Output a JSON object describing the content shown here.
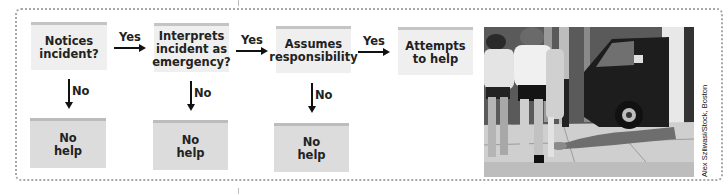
{
  "diagram": {
    "steps": [
      {
        "id": "notices",
        "label": "Notices\nincident?"
      },
      {
        "id": "interprets",
        "label": "Interprets\nincident as\nemergency?"
      },
      {
        "id": "assumes",
        "label": "Assumes\nresponsibility"
      },
      {
        "id": "attempts",
        "label": "Attempts\nto help"
      }
    ],
    "outcomes": [
      {
        "id": "nohelp1",
        "label": "No\nhelp"
      },
      {
        "id": "nohelp2",
        "label": "No\nhelp"
      },
      {
        "id": "nohelp3",
        "label": "No\nhelp"
      }
    ],
    "edges": {
      "yes_label": "Yes",
      "no_label": "No",
      "yes": [
        {
          "from": "notices",
          "to": "interprets",
          "label": "Yes"
        },
        {
          "from": "interprets",
          "to": "assumes",
          "label": "Yes"
        },
        {
          "from": "assumes",
          "to": "attempts",
          "label": "Yes"
        }
      ],
      "no": [
        {
          "from": "notices",
          "to": "nohelp1",
          "label": "No"
        },
        {
          "from": "interprets",
          "to": "nohelp2",
          "label": "No"
        },
        {
          "from": "assumes",
          "to": "nohelp3",
          "label": "No"
        }
      ]
    },
    "colors": {
      "step_fill": "#efefef",
      "outcome_fill": "#dcdcdc",
      "top_stripe": "#c4c4c4",
      "frame_dots": "#a8a8a8",
      "arrow": "#111111"
    }
  },
  "photo": {
    "description": "Black-and-white street photo: pedestrians walk past a man lying on the sidewalk beside a dark van",
    "credit": "Alex Szilwasi/Stock, Boston"
  }
}
